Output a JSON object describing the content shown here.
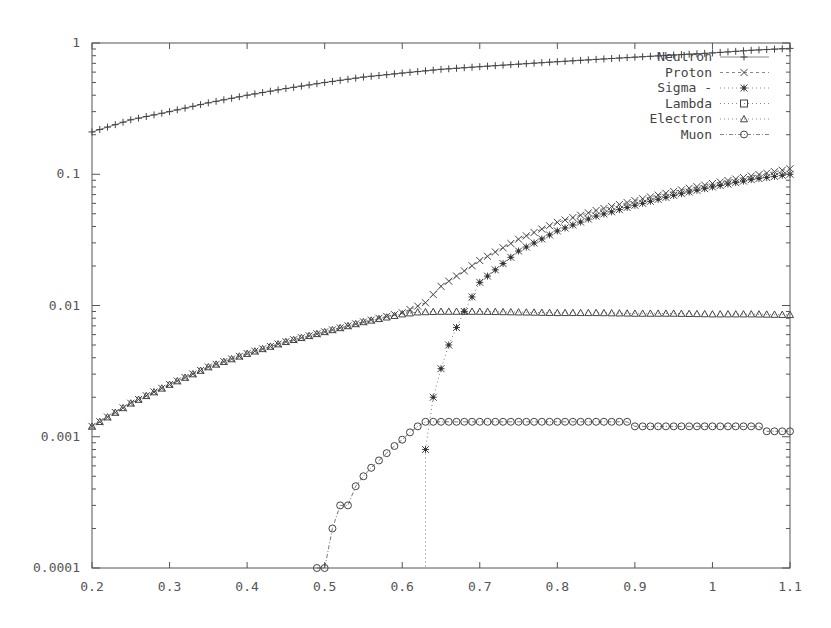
{
  "chart_data": {
    "type": "line",
    "title": "",
    "xlabel": "",
    "ylabel": "",
    "xlim": [
      0.2,
      1.1
    ],
    "ylim": [
      0.0001,
      1
    ],
    "yscale": "log",
    "grid": false,
    "legend_position": "top-right (inside)",
    "x_ticks": [
      "0.2",
      "0.3",
      "0.4",
      "0.5",
      "0.6",
      "0.7",
      "0.8",
      "0.9",
      "1",
      "1.1"
    ],
    "y_ticks": [
      "0.0001",
      "0.001",
      "0.01",
      "0.1",
      "1"
    ],
    "series": [
      {
        "name": "Neutron",
        "marker": "plus",
        "line": "solid",
        "x": [
          0.2,
          0.25,
          0.3,
          0.35,
          0.4,
          0.45,
          0.5,
          0.55,
          0.6,
          0.65,
          0.7,
          0.75,
          0.8,
          0.85,
          0.9,
          0.95,
          1.0,
          1.05,
          1.1
        ],
        "y": [
          0.21,
          0.26,
          0.3,
          0.35,
          0.4,
          0.45,
          0.5,
          0.55,
          0.59,
          0.63,
          0.66,
          0.69,
          0.72,
          0.75,
          0.78,
          0.81,
          0.84,
          0.88,
          0.91
        ]
      },
      {
        "name": "Proton",
        "marker": "x",
        "line": "dashed",
        "x": [
          0.2,
          0.25,
          0.3,
          0.35,
          0.4,
          0.45,
          0.5,
          0.55,
          0.6,
          0.63,
          0.65,
          0.7,
          0.75,
          0.8,
          0.85,
          0.9,
          0.95,
          1.0,
          1.05,
          1.1
        ],
        "y": [
          0.0012,
          0.0018,
          0.0025,
          0.0034,
          0.0043,
          0.0053,
          0.0063,
          0.0075,
          0.0088,
          0.0105,
          0.014,
          0.022,
          0.032,
          0.043,
          0.053,
          0.063,
          0.074,
          0.085,
          0.097,
          0.11
        ]
      },
      {
        "name": "Sigma -",
        "marker": "star",
        "line": "dotted",
        "x": [
          0.63,
          0.64,
          0.65,
          0.66,
          0.67,
          0.68,
          0.7,
          0.75,
          0.8,
          0.85,
          0.9,
          0.95,
          1.0,
          1.05,
          1.1
        ],
        "y": [
          0.0008,
          0.002,
          0.0033,
          0.005,
          0.0068,
          0.009,
          0.015,
          0.026,
          0.037,
          0.048,
          0.058,
          0.069,
          0.08,
          0.091,
          0.1
        ]
      },
      {
        "name": "Lambda",
        "marker": "square",
        "line": "dotted",
        "x": [],
        "y": []
      },
      {
        "name": "Electron",
        "marker": "triangle",
        "line": "dotted",
        "x": [
          0.2,
          0.25,
          0.3,
          0.35,
          0.4,
          0.45,
          0.5,
          0.55,
          0.6,
          0.62,
          0.65,
          0.7,
          0.75,
          0.8,
          0.85,
          0.9,
          0.95,
          1.0,
          1.05,
          1.1
        ],
        "y": [
          0.0012,
          0.0018,
          0.0025,
          0.0034,
          0.0043,
          0.0053,
          0.0063,
          0.0075,
          0.0086,
          0.0089,
          0.009,
          0.009,
          0.0089,
          0.0088,
          0.0088,
          0.0087,
          0.0087,
          0.0086,
          0.0086,
          0.0085
        ]
      },
      {
        "name": "Muon",
        "marker": "circle",
        "line": "dash-dot",
        "x": [
          0.49,
          0.5,
          0.51,
          0.52,
          0.53,
          0.54,
          0.55,
          0.56,
          0.57,
          0.58,
          0.59,
          0.6,
          0.61,
          0.62,
          0.63,
          0.7,
          0.8,
          0.89,
          0.9,
          1.0,
          1.06,
          1.07,
          1.1
        ],
        "y": [
          0.0001,
          0.0001,
          0.0002,
          0.0003,
          0.0003,
          0.00042,
          0.0005,
          0.00058,
          0.00066,
          0.00075,
          0.00085,
          0.00095,
          0.00108,
          0.0012,
          0.0013,
          0.0013,
          0.0013,
          0.0013,
          0.0012,
          0.0012,
          0.0012,
          0.0011,
          0.0011
        ]
      }
    ]
  }
}
